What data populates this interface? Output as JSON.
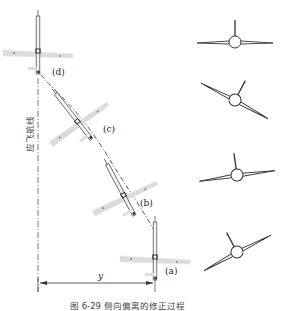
{
  "diagram": {
    "track_label": "应飞航线",
    "offset_label": "y",
    "caption": "图 6-29  侧向偏离的修正过程",
    "positions": [
      {
        "id": "a",
        "label": "(a)"
      },
      {
        "id": "b",
        "label": "(b)"
      },
      {
        "id": "c",
        "label": "(c)"
      },
      {
        "id": "d",
        "label": "(d)"
      }
    ],
    "colors": {
      "wing_fill": "#dcdcdc",
      "line": "#333333",
      "background": "#ffffff"
    }
  }
}
